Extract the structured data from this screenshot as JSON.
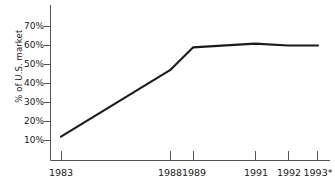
{
  "chart_data": {
    "type": "line",
    "title": "",
    "subtitle": "",
    "xlabel": "",
    "ylabel": "% of U.S. market",
    "x": [
      "1983",
      "1988",
      "1989",
      "1991",
      "1992",
      "1993*"
    ],
    "categories": [
      "1983",
      "1988",
      "1989",
      "1991",
      "1992",
      "1993*"
    ],
    "values": [
      12,
      47,
      59,
      61,
      60,
      60
    ],
    "series": [
      {
        "name": "% of U.S. market",
        "values": [
          12,
          47,
          59,
          61,
          60,
          60
        ]
      }
    ],
    "xtick_labels": [
      "1983",
      "1988",
      "1989",
      "1991",
      "1992",
      "1993*"
    ],
    "ytick_labels": [
      "10%",
      "20%",
      "30%",
      "40%",
      "50%",
      "60%",
      "70%"
    ],
    "ytick_values": [
      10,
      20,
      30,
      40,
      50,
      60,
      70
    ],
    "ylim": [
      4,
      74
    ],
    "xlim": [
      1983,
      1993
    ],
    "grid": false,
    "legend": false,
    "legend_position": "none",
    "line_color": "#1a1a1a",
    "axis_color": "#555555",
    "background_color": "#ffffff",
    "footnote_marker": "*"
  },
  "axes": {
    "y_axis_title": "% of U.S. market"
  }
}
